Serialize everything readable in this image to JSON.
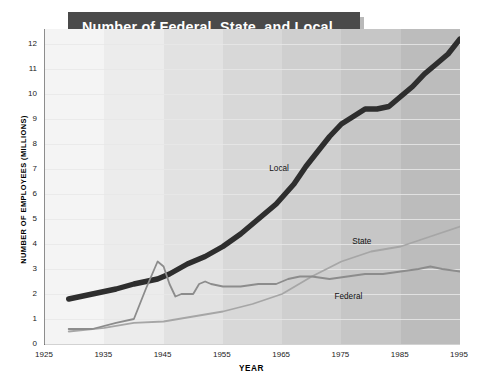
{
  "title": {
    "line1": "Number of Federal, State, and Local",
    "line2_main": "Government Employees,",
    "line2_years": "1929–1995"
  },
  "chart_data": {
    "type": "line",
    "title": "Number of Federal, State, and Local Government Employees, 1929–1995",
    "xlabel": "YEAR",
    "ylabel": "NUMBER OF EMPLOYEES (MILLIONS)",
    "xlim": [
      1925,
      1995
    ],
    "ylim": [
      0,
      12.6
    ],
    "grid": true,
    "legend_position": "inline-annotations",
    "xticks": [
      1925,
      1935,
      1945,
      1955,
      1965,
      1975,
      1985,
      1995
    ],
    "yticks": [
      0,
      1,
      2,
      3,
      4,
      5,
      6,
      7,
      8,
      9,
      10,
      11,
      12
    ],
    "series": [
      {
        "name": "Local",
        "color": "#2e2e2e",
        "width": 5.4,
        "label_x": 1963,
        "label_y": 7.2,
        "x": [
          1929,
          1933,
          1937,
          1940,
          1944,
          1946,
          1949,
          1952,
          1955,
          1958,
          1961,
          1964,
          1967,
          1969,
          1971,
          1973,
          1975,
          1977,
          1979,
          1981,
          1983,
          1985,
          1987,
          1989,
          1991,
          1993,
          1995
        ],
        "y": [
          1.8,
          2.0,
          2.2,
          2.4,
          2.6,
          2.8,
          3.2,
          3.5,
          3.9,
          4.4,
          5.0,
          5.6,
          6.4,
          7.1,
          7.7,
          8.3,
          8.8,
          9.1,
          9.4,
          9.4,
          9.5,
          9.9,
          10.3,
          10.8,
          11.2,
          11.6,
          12.2
        ]
      },
      {
        "name": "State",
        "color": "#a6a6a6",
        "width": 1.8,
        "label_x": 1977,
        "label_y": 4.3,
        "x": [
          1929,
          1935,
          1940,
          1945,
          1950,
          1955,
          1960,
          1965,
          1970,
          1975,
          1980,
          1985,
          1990,
          1995
        ],
        "y": [
          0.5,
          0.65,
          0.85,
          0.9,
          1.1,
          1.3,
          1.6,
          2.0,
          2.7,
          3.3,
          3.7,
          3.9,
          4.3,
          4.7
        ]
      },
      {
        "name": "Federal",
        "color": "#8c8c8c",
        "width": 1.8,
        "label_x": 1974,
        "label_y": 2.1,
        "x": [
          1929,
          1933,
          1937,
          1940,
          1942,
          1944,
          1945,
          1946,
          1947,
          1948,
          1950,
          1951,
          1952,
          1953,
          1955,
          1958,
          1961,
          1964,
          1966,
          1968,
          1970,
          1973,
          1976,
          1979,
          1982,
          1985,
          1988,
          1990,
          1992,
          1995
        ],
        "y": [
          0.6,
          0.6,
          0.85,
          1.0,
          2.2,
          3.3,
          3.1,
          2.4,
          1.9,
          2.0,
          2.0,
          2.4,
          2.5,
          2.4,
          2.3,
          2.3,
          2.4,
          2.4,
          2.6,
          2.7,
          2.7,
          2.6,
          2.7,
          2.8,
          2.8,
          2.9,
          3.0,
          3.1,
          3.0,
          2.9
        ]
      }
    ],
    "background_bands": [
      "#f4f4f4",
      "#ececec",
      "#e2e2e2",
      "#d8d8d8",
      "#cfcfcf",
      "#c6c6c6",
      "#bcbcbc"
    ]
  }
}
